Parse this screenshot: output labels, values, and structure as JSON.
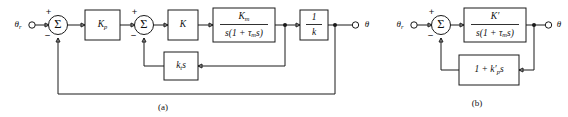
{
  "figure": {
    "background_color": "#ffffff",
    "line_color": "#1a1a1a",
    "panels": [
      {
        "id": "a",
        "caption": "(a)",
        "input_label": "θr",
        "input_label_base": "θ",
        "input_label_sub": "r",
        "output_label": "θ",
        "summers": [
          {
            "name": "summer-1",
            "glyph": "Σ",
            "plus": "+",
            "minus": "−"
          },
          {
            "name": "summer-2",
            "glyph": "Σ",
            "plus": "+",
            "minus": "−"
          }
        ],
        "blocks": [
          {
            "name": "gain-kp",
            "type": "gain",
            "label": "Kp",
            "base": "K",
            "sub": "p"
          },
          {
            "name": "gain-k",
            "type": "gain",
            "label": "K",
            "base": "K",
            "sub": ""
          },
          {
            "name": "motor-transfer-function",
            "type": "fraction",
            "numerator": "Km",
            "num_base": "K",
            "num_sub": "m",
            "denominator": "s(1 + τm s)",
            "den_pre": "s(1 + ",
            "den_tau": "τ",
            "den_tau_sub": "m",
            "den_post": "s)"
          },
          {
            "name": "gain-one-over-k",
            "type": "fraction",
            "numerator": "1",
            "denominator": "k"
          },
          {
            "name": "tach-feedback-gain",
            "type": "gain",
            "label": "kt s",
            "base": "k",
            "sub": "t",
            "suffix": "s"
          }
        ]
      },
      {
        "id": "b",
        "caption": "(b)",
        "input_label": "θr",
        "input_label_base": "θ",
        "input_label_sub": "r",
        "output_label": "θ",
        "summers": [
          {
            "name": "summer-1",
            "glyph": "Σ",
            "plus": "+",
            "minus": "−"
          }
        ],
        "blocks": [
          {
            "name": "forward-transfer-function",
            "type": "fraction",
            "numerator": "K'",
            "num_base": "K",
            "num_prime": "′",
            "denominator": "s(1 + τm s)",
            "den_pre": "s(1 + ",
            "den_tau": "τ",
            "den_tau_sub": "m",
            "den_post": "s)"
          },
          {
            "name": "feedback-compensator",
            "type": "gain",
            "label": "1 + k'p s",
            "pre": "1 + ",
            "base": "k",
            "prime": "′",
            "sub": "p",
            "suffix": "s"
          }
        ]
      }
    ]
  }
}
